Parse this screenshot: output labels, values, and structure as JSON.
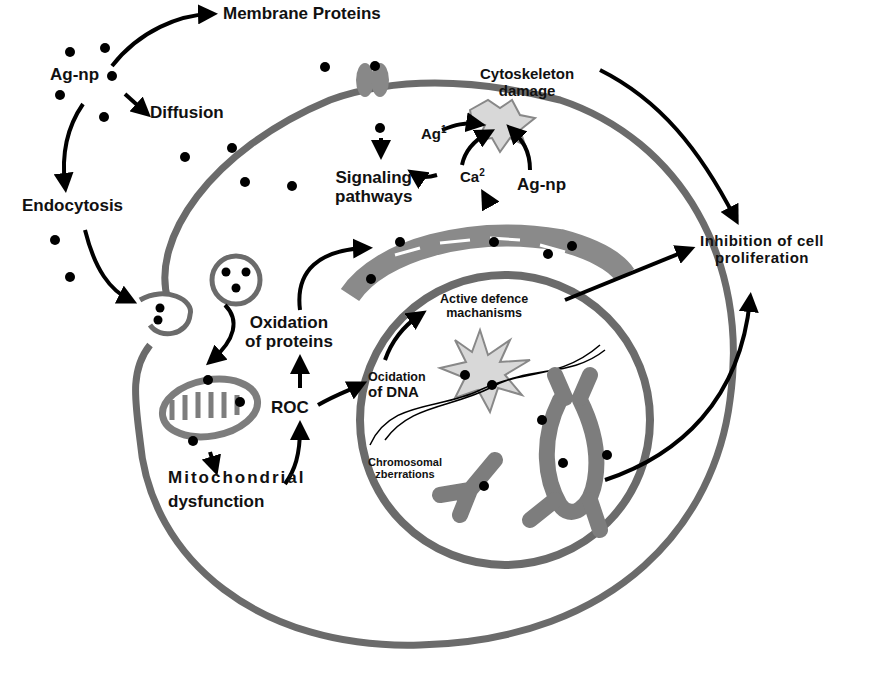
{
  "diagram": {
    "colors": {
      "membrane": "#6b6b6b",
      "organelle": "#7d7d7d",
      "particle": "#000000",
      "damage_fill": "#d8d8d8",
      "arrow": "#000000",
      "text": "#111111"
    },
    "labels": {
      "ag_np_outside": "Ag-np",
      "membrane_proteins": "Membrane Proteins",
      "diffusion": "Diffusion",
      "endocytosis": "Endocytosis",
      "cytoskeleton_damage_l1": "Cytoskeleton",
      "cytoskeleton_damage_l2": "damage",
      "ag_ion": "Ag",
      "ag_ion_sup": "1",
      "calcium": "Ca",
      "calcium_sup": "2",
      "ag_np_inside": "Ag-np",
      "signaling_l1": "Signaling",
      "signaling_l2": "pathways",
      "inhibition_l1": "Inhibition of cell",
      "inhibition_l2": "proliferation",
      "oxidation_proteins_l1": "Oxidation",
      "oxidation_proteins_l2": "of proteins",
      "active_defence_l1": "Active defence",
      "active_defence_l2": "machanisms",
      "roc": "ROC",
      "oxidation_dna_l1": "Ocidation",
      "oxidation_dna_l2": "of DNA",
      "chromosomal_l1": "Chromosomal",
      "chromosomal_l2": "zberrations",
      "mito_l1": "Mitochondrial",
      "mito_l2": "dysfunction"
    },
    "nodes": [
      "Ag-np",
      "Membrane Proteins",
      "Diffusion",
      "Endocytosis",
      "Cytoskeleton damage",
      "Signaling pathways",
      "Inhibition of cell proliferation",
      "Oxidation of proteins",
      "ROC",
      "Ocidation of DNA",
      "Active defence machanisms",
      "Chromosomal zberrations",
      "Mitochondrial dysfunction"
    ],
    "edges": [
      [
        "Ag-np",
        "Membrane Proteins"
      ],
      [
        "Ag-np",
        "Diffusion"
      ],
      [
        "Ag-np",
        "Endocytosis"
      ],
      [
        "Endocytosis",
        "Mitochondria"
      ],
      [
        "Membrane Proteins",
        "Signaling pathways"
      ],
      [
        "Ca2",
        "Signaling pathways"
      ],
      [
        "Ag1",
        "Cytoskeleton damage"
      ],
      [
        "Ca2",
        "Cytoskeleton damage"
      ],
      [
        "Ag-np",
        "Cytoskeleton damage"
      ],
      [
        "Cytoskeleton damage",
        "Inhibition of cell proliferation"
      ],
      [
        "Mitochondrial dysfunction",
        "ROC"
      ],
      [
        "ROC",
        "Oxidation of proteins"
      ],
      [
        "ROC",
        "Ocidation of DNA"
      ],
      [
        "Oxidation of proteins",
        "Endoplasmic reticulum"
      ],
      [
        "Ocidation of DNA",
        "Active defence machanisms"
      ],
      [
        "Active defence machanisms",
        "Inhibition of cell proliferation"
      ],
      [
        "Chromosomal zberrations",
        "Inhibition of cell proliferation"
      ]
    ]
  }
}
